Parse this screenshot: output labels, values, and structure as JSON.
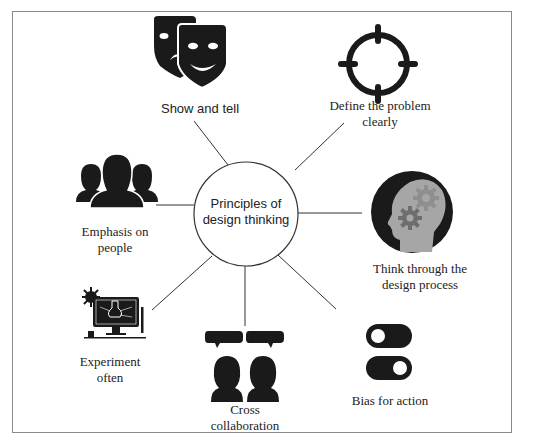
{
  "diagram": {
    "title": "Principles of design thinking",
    "center": {
      "line1": "Principles of",
      "line2": "design thinking"
    },
    "nodes": [
      {
        "id": "show-and-tell",
        "label": "Show and tell",
        "icon": "theater-masks-icon"
      },
      {
        "id": "define-problem",
        "line1": "Define the problem",
        "line2": "clearly",
        "icon": "crosshair-target-icon"
      },
      {
        "id": "think-through",
        "line1": "Think through the",
        "line2": "design process",
        "icon": "head-gears-icon"
      },
      {
        "id": "bias-for-action",
        "label": "Bias for action",
        "icon": "toggle-switches-icon"
      },
      {
        "id": "cross-collaboration",
        "line1": "Cross",
        "line2": "collaboration",
        "icon": "people-speech-bubbles-icon"
      },
      {
        "id": "experiment-often",
        "line1": "Experiment",
        "line2": "often",
        "icon": "computer-flask-icon"
      },
      {
        "id": "emphasis-on-people",
        "line1": "Emphasis on",
        "line2": "people",
        "icon": "people-group-icon"
      }
    ],
    "colors": {
      "icon": "#1a1a1a",
      "head_fill": "#a6a6a6",
      "gear_dark": "#6e6e6e",
      "gear_light": "#8f8f8f",
      "line": "#333333",
      "frame": "#8a8a8a"
    }
  }
}
